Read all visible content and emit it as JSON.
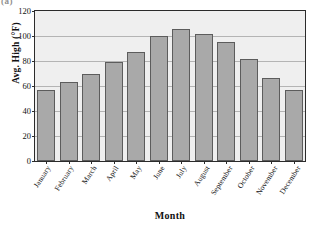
{
  "panel_label": "(a)",
  "chart_data": {
    "type": "bar",
    "title": "",
    "xlabel": "Month",
    "ylabel": "Avg. High (°F)",
    "categories": [
      "January",
      "February",
      "March",
      "April",
      "May",
      "June",
      "July",
      "August",
      "September",
      "October",
      "November",
      "December"
    ],
    "values": [
      57,
      63,
      70,
      79,
      87.5,
      100,
      105.5,
      102,
      95,
      82,
      66.5,
      57
    ],
    "ylim": [
      0,
      120
    ],
    "yticks": [
      0,
      20,
      40,
      60,
      80,
      100,
      120
    ],
    "ytick_labels": [
      "0",
      "20",
      "40",
      "60",
      "80",
      "100",
      "120"
    ],
    "grid": true,
    "legend": false,
    "colors": {
      "bar_fill": "#a9a9a9",
      "bar_stroke": "#5c5c5c",
      "plot_background": "#efefef",
      "axis": "#2b2b2b",
      "gridline": "#b4b4b4"
    }
  }
}
